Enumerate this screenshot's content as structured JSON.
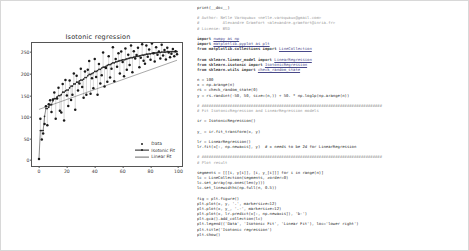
{
  "chart_data": {
    "type": "scatter",
    "title": "Isotonic regression",
    "xlabel": "",
    "ylabel": "",
    "xlim": [
      -5,
      104
    ],
    "ylim": [
      -18,
      272
    ],
    "xticks": [
      "0",
      "20",
      "40",
      "60",
      "80",
      "100"
    ],
    "xtick_values": [
      0,
      20,
      40,
      60,
      80,
      100
    ],
    "yticks": [
      "0",
      "50",
      "100",
      "150",
      "200",
      "250"
    ],
    "ytick_values": [
      0,
      50,
      100,
      150,
      200,
      250
    ],
    "grid": false,
    "legend_position": "lower right",
    "series": [
      {
        "name": "Data",
        "marker": "dot",
        "color": "#1f1f1f"
      },
      {
        "name": "Isotonic Fit",
        "marker": "dot-line",
        "color": "#1f1f1f"
      },
      {
        "name": "Linear Fit",
        "marker": "line",
        "color": "#6e6e6e"
      }
    ],
    "x": [
      0,
      1,
      2,
      3,
      4,
      5,
      6,
      7,
      8,
      9,
      10,
      11,
      12,
      13,
      14,
      15,
      16,
      17,
      18,
      19,
      20,
      21,
      22,
      23,
      24,
      25,
      26,
      27,
      28,
      29,
      30,
      31,
      32,
      33,
      34,
      35,
      36,
      37,
      38,
      39,
      40,
      41,
      42,
      43,
      44,
      45,
      46,
      47,
      48,
      49,
      50,
      51,
      52,
      53,
      54,
      55,
      56,
      57,
      58,
      59,
      60,
      61,
      62,
      63,
      64,
      65,
      66,
      67,
      68,
      69,
      70,
      71,
      72,
      73,
      74,
      75,
      76,
      77,
      78,
      79,
      80,
      81,
      82,
      83,
      84,
      85,
      86,
      87,
      88,
      89,
      90,
      91,
      92,
      93,
      94,
      95,
      96,
      97,
      98,
      99
    ],
    "data_y": [
      3,
      96,
      48,
      62,
      84,
      125,
      81,
      130,
      139,
      112,
      141,
      157,
      96,
      143,
      168,
      115,
      111,
      177,
      92,
      186,
      150,
      126,
      185,
      140,
      152,
      201,
      117,
      196,
      162,
      178,
      212,
      170,
      145,
      206,
      152,
      210,
      230,
      154,
      190,
      167,
      235,
      193,
      152,
      223,
      178,
      197,
      250,
      171,
      214,
      182,
      241,
      192,
      212,
      262,
      183,
      235,
      217,
      248,
      201,
      252,
      228,
      195,
      259,
      210,
      245,
      221,
      266,
      204,
      253,
      236,
      244,
      261,
      216,
      238,
      269,
      231,
      224,
      266,
      240,
      257,
      233,
      271,
      248,
      229,
      262,
      245,
      252,
      236,
      268,
      243,
      256,
      234,
      261,
      250,
      239,
      247,
      258,
      241,
      253,
      246
    ],
    "isotonic_y": [
      3,
      69,
      69,
      69,
      102,
      120,
      120,
      123,
      129,
      129,
      138,
      143,
      143,
      147,
      150,
      150,
      152,
      158,
      158,
      161,
      163,
      163,
      168,
      172,
      172,
      177,
      177,
      181,
      181,
      184,
      186,
      186,
      188,
      192,
      192,
      196,
      199,
      199,
      201,
      203,
      206,
      206,
      208,
      211,
      211,
      214,
      216,
      216,
      218,
      220,
      222,
      222,
      224,
      226,
      226,
      228,
      229,
      230,
      231,
      232,
      233,
      233,
      234,
      235,
      236,
      237,
      238,
      238,
      239,
      240,
      241,
      241,
      242,
      243,
      244,
      244,
      245,
      246,
      246,
      247,
      247,
      248,
      248,
      249,
      249,
      250,
      250,
      250,
      251,
      251,
      251,
      251,
      252,
      252,
      252,
      252,
      252,
      252,
      252,
      252
    ],
    "linear_start": [
      0,
      118
    ],
    "linear_end": [
      99,
      232
    ]
  },
  "code": {
    "lines": [
      {
        "t": "print(__doc__)",
        "k": "plain"
      },
      {
        "t": "",
        "k": "blank"
      },
      {
        "t": "# Author: Nelle Varoquaux <nelle.varoquaux@gmail.com>",
        "k": "comment"
      },
      {
        "t": "#          Alexandre Gramfort <alexandre.gramfort@inria.fr>",
        "k": "comment"
      },
      {
        "t": "# License: BSD",
        "k": "comment"
      },
      {
        "t": "",
        "k": "blank"
      },
      {
        "t": "import numpy as np",
        "k": "import"
      },
      {
        "t": "import matplotlib.pyplot as plt",
        "k": "import"
      },
      {
        "t": "from matplotlib.collections import LineCollection",
        "k": "import"
      },
      {
        "t": "",
        "k": "blank"
      },
      {
        "t": "from sklearn.linear_model import LinearRegression",
        "k": "import"
      },
      {
        "t": "from sklearn.isotonic import IsotonicRegression",
        "k": "import"
      },
      {
        "t": "from sklearn.utils import check_random_state",
        "k": "import"
      },
      {
        "t": "",
        "k": "blank"
      },
      {
        "t": "n = 100",
        "k": "plain"
      },
      {
        "t": "x = np.arange(n)",
        "k": "plain"
      },
      {
        "t": "rs = check_random_state(0)",
        "k": "plain"
      },
      {
        "t": "y = rs.randint(-50, 50, size=(n,)) + 50. * np.log1p(np.arange(n))",
        "k": "plain"
      },
      {
        "t": "",
        "k": "blank"
      },
      {
        "t": "# #############################################################################",
        "k": "comment"
      },
      {
        "t": "# Fit IsotonicRegression and LinearRegression models",
        "k": "comment"
      },
      {
        "t": "",
        "k": "blank"
      },
      {
        "t": "ir = IsotonicRegression()",
        "k": "plain"
      },
      {
        "t": "",
        "k": "blank"
      },
      {
        "t": "y_ = ir.fit_transform(x, y)",
        "k": "plain"
      },
      {
        "t": "",
        "k": "blank"
      },
      {
        "t": "lr = LinearRegression()",
        "k": "plain"
      },
      {
        "t": "lr.fit(x[:, np.newaxis], y)  # x needs to be 2d for LinearRegression",
        "k": "plain"
      },
      {
        "t": "",
        "k": "blank"
      },
      {
        "t": "# #############################################################################",
        "k": "comment"
      },
      {
        "t": "# Plot result",
        "k": "comment"
      },
      {
        "t": "",
        "k": "blank"
      },
      {
        "t": "segments = [[[i, y[i]], [i, y_[i]]] for i in range(n)]",
        "k": "plain"
      },
      {
        "t": "lc = LineCollection(segments, zorder=0)",
        "k": "plain"
      },
      {
        "t": "lc.set_array(np.ones(len(y)))",
        "k": "plain"
      },
      {
        "t": "lc.set_linewidths(np.full(n, 0.5))",
        "k": "plain"
      },
      {
        "t": "",
        "k": "blank"
      },
      {
        "t": "fig = plt.figure()",
        "k": "plain"
      },
      {
        "t": "plt.plot(x, y, '.', markersize=12)",
        "k": "plain"
      },
      {
        "t": "plt.plot(x, y_, '.-', markersize=12)",
        "k": "plain"
      },
      {
        "t": "plt.plot(x, lr.predict(x[:, np.newaxis]), 'b-')",
        "k": "plain"
      },
      {
        "t": "plt.gca().add_collection(lc)",
        "k": "plain"
      },
      {
        "t": "plt.legend(('Data', 'Isotonic Fit', 'Linear Fit'), loc='lower right')",
        "k": "plain"
      },
      {
        "t": "plt.title('Isotonic regression')",
        "k": "plain"
      },
      {
        "t": "plt.show()",
        "k": "plain"
      }
    ]
  }
}
